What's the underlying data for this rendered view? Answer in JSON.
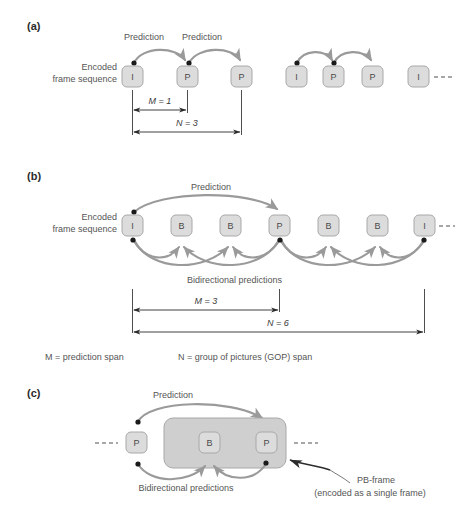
{
  "figure": {
    "colors": {
      "frame_fill": "#dcdcdc",
      "frame_stroke": "#a8a8a8",
      "arrow_gray": "#9a9a9a",
      "dot_black": "#1a1a1a",
      "pb_group_fill": "#cfcfcf",
      "text_gray": "#555555"
    }
  },
  "panels": [
    {
      "id": "a",
      "label": "(a)",
      "sequence_label_line1": "Encoded",
      "sequence_label_line2": "frame sequence",
      "frames": [
        {
          "type": "I",
          "x": 132
        },
        {
          "type": "P",
          "x": 187
        },
        {
          "type": "P",
          "x": 241
        },
        {
          "type": "I",
          "x": 296
        },
        {
          "type": "P",
          "x": 330
        },
        {
          "type": "P",
          "x": 369
        },
        {
          "type": "I",
          "x": 417
        }
      ],
      "prediction_labels": [
        "Prediction",
        "Prediction"
      ],
      "spans": [
        {
          "name": "M",
          "text": "M = 1",
          "value": 1
        },
        {
          "name": "N",
          "text": "N = 3",
          "value": 3
        }
      ],
      "trailing_dashes": true
    },
    {
      "id": "b",
      "label": "(b)",
      "sequence_label_line1": "Encoded",
      "sequence_label_line2": "frame sequence",
      "frames": [
        {
          "type": "I",
          "x": 132
        },
        {
          "type": "B",
          "x": 181
        },
        {
          "type": "B",
          "x": 230
        },
        {
          "type": "P",
          "x": 279
        },
        {
          "type": "B",
          "x": 328
        },
        {
          "type": "B",
          "x": 377
        },
        {
          "type": "I",
          "x": 424
        }
      ],
      "prediction_label": "Prediction",
      "bidirectional_label": "Bidirectional predictions",
      "spans": [
        {
          "name": "M",
          "text": "M = 3",
          "value": 3
        },
        {
          "name": "N",
          "text": "N = 6",
          "value": 6
        }
      ],
      "trailing_dashes": true
    },
    {
      "id": "c",
      "label": "(c)",
      "frames": [
        {
          "type": "P",
          "x": 136
        },
        {
          "type": "B",
          "x": 209
        },
        {
          "type": "P",
          "x": 266
        }
      ],
      "prediction_label": "Prediction",
      "bidirectional_label": "Bidirectional predictions",
      "callout_line1": "PB-frame",
      "callout_line2": "(encoded as a single frame)",
      "leading_dashes": true,
      "trailing_dashes": true
    }
  ],
  "legend": {
    "m_definition": "M = prediction span",
    "n_definition": "N = group of pictures (GOP) span"
  }
}
